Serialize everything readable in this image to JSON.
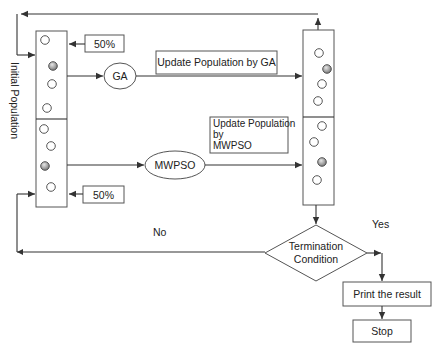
{
  "diagram": {
    "side_label": "Initial Population",
    "left_column": {
      "upper_half_share": "50%",
      "lower_half_share": "50%"
    },
    "operators": {
      "ga": "GA",
      "mwpso": "MWPSO"
    },
    "update_boxes": {
      "ga": "Update Population by GA",
      "mwpso_lines": [
        "Update Population",
        "by",
        "MWPSO"
      ]
    },
    "decision": {
      "lines": [
        "Termination",
        "Condition"
      ],
      "yes_label": "Yes",
      "no_label": "No"
    },
    "print_box": "Print the result",
    "stop_box": "Stop",
    "colors": {
      "stroke": "#333333",
      "shaded_particle": "#8a8a8a",
      "background": "#ffffff"
    }
  }
}
